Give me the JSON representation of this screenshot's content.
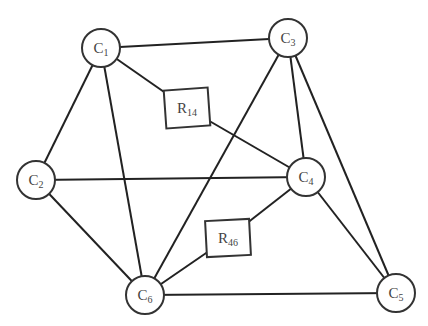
{
  "diagram": {
    "nodes": [
      {
        "id": "C1",
        "main": "C",
        "sub": "1",
        "shape": "circle",
        "x": 101,
        "y": 48,
        "r": 19
      },
      {
        "id": "C2",
        "main": "C",
        "sub": "2",
        "shape": "circle",
        "x": 36,
        "y": 180,
        "r": 19
      },
      {
        "id": "C3",
        "main": "C",
        "sub": "3",
        "shape": "circle",
        "x": 288,
        "y": 38,
        "r": 19
      },
      {
        "id": "C4",
        "main": "C",
        "sub": "4",
        "shape": "circle",
        "x": 306,
        "y": 177,
        "r": 19
      },
      {
        "id": "C5",
        "main": "C",
        "sub": "5",
        "shape": "circle",
        "x": 396,
        "y": 293,
        "r": 19
      },
      {
        "id": "C6",
        "main": "C",
        "sub": "6",
        "shape": "circle",
        "x": 145,
        "y": 295,
        "r": 19
      },
      {
        "id": "R14",
        "main": "R",
        "sub": "14",
        "shape": "rect",
        "x": 187,
        "y": 108,
        "w": 44,
        "h": 38
      },
      {
        "id": "R46",
        "main": "R",
        "sub": "46",
        "shape": "rect",
        "x": 228,
        "y": 238,
        "w": 44,
        "h": 36
      }
    ],
    "edges": [
      [
        "C1",
        "C3"
      ],
      [
        "C1",
        "R14"
      ],
      [
        "R14",
        "C4"
      ],
      [
        "C1",
        "C2"
      ],
      [
        "C1",
        "C6"
      ],
      [
        "C3",
        "C6"
      ],
      [
        "C3",
        "C4"
      ],
      [
        "C3",
        "C5"
      ],
      [
        "C2",
        "C4"
      ],
      [
        "C2",
        "C6"
      ],
      [
        "C4",
        "R46"
      ],
      [
        "R46",
        "C6"
      ],
      [
        "C4",
        "C5"
      ],
      [
        "C6",
        "C5"
      ]
    ]
  }
}
